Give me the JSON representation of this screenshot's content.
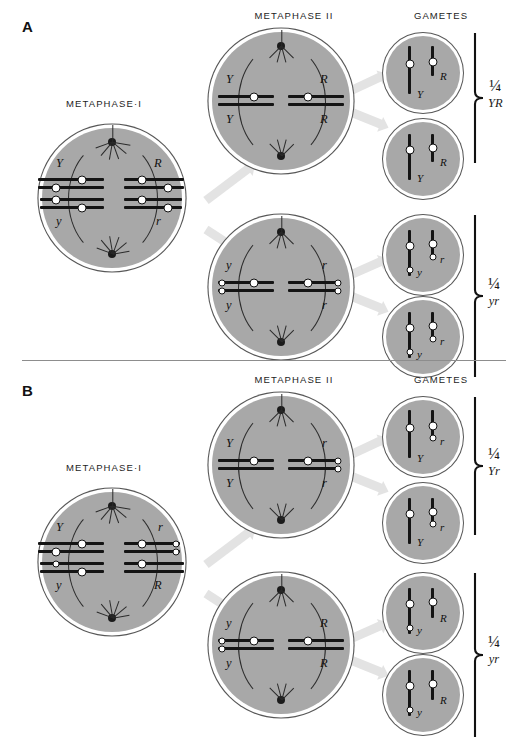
{
  "figure": {
    "panels": [
      {
        "letter": "A",
        "headings": {
          "metaphase1": "METAPHASE·I",
          "metaphase2": "METAPHASE II",
          "gametes": "GAMETES"
        },
        "metaphase1": {
          "left_top_allele": "Y",
          "left_bottom_allele": "y",
          "right_top_allele": "R",
          "right_bottom_allele": "r"
        },
        "metaphase2_cells": [
          {
            "left_top": "Y",
            "left_bottom": "Y",
            "right_top": "R",
            "right_bottom": "R"
          },
          {
            "left_top": "y",
            "left_bottom": "y",
            "right_top": "r",
            "right_bottom": "r"
          }
        ],
        "gamete_groups": [
          {
            "fraction": "¼",
            "genotype": "YR",
            "cells": [
              {
                "left_allele": "Y",
                "right_allele": "R"
              },
              {
                "left_allele": "Y",
                "right_allele": "R"
              }
            ]
          },
          {
            "fraction": "¼",
            "genotype": "yr",
            "cells": [
              {
                "left_allele": "y",
                "right_allele": "r"
              },
              {
                "left_allele": "y",
                "right_allele": "r"
              }
            ]
          }
        ]
      },
      {
        "letter": "B",
        "headings": {
          "metaphase1": "METAPHASE·I",
          "metaphase2": "METAPHASE II",
          "gametes": "GAMETES"
        },
        "metaphase1": {
          "left_top_allele": "Y",
          "left_bottom_allele": "y",
          "right_top_allele": "r",
          "right_bottom_allele": "R"
        },
        "metaphase2_cells": [
          {
            "left_top": "Y",
            "left_bottom": "Y",
            "right_top": "r",
            "right_bottom": "r"
          },
          {
            "left_top": "y",
            "left_bottom": "y",
            "right_top": "R",
            "right_bottom": "R"
          }
        ],
        "gamete_groups": [
          {
            "fraction": "¼",
            "genotype": "Yr",
            "cells": [
              {
                "left_allele": "Y",
                "right_allele": "r"
              },
              {
                "left_allele": "Y",
                "right_allele": "r"
              }
            ]
          },
          {
            "fraction": "¼",
            "genotype": "yr",
            "cells": [
              {
                "left_allele": "y",
                "right_allele": "R"
              },
              {
                "left_allele": "y",
                "right_allele": "R"
              }
            ]
          }
        ]
      }
    ],
    "colors": {
      "cytoplasm": "#a8a8a8",
      "chromosome": "#141414",
      "arrow": "#e3e3e3",
      "outline": "#575757",
      "background": "#ffffff"
    }
  }
}
